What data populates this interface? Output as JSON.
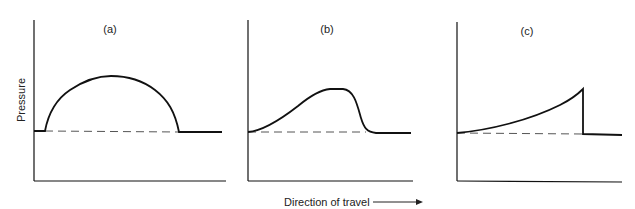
{
  "figure": {
    "y_axis_label": "Pressure",
    "x_axis_label": "Direction of travel",
    "panels": [
      {
        "label": "(a)",
        "shape": "semicircular pressure bulge"
      },
      {
        "label": "(b)",
        "shape": "gradual rise, sharp fall"
      },
      {
        "label": "(c)",
        "shape": "rising curve with abrupt drop"
      }
    ],
    "colors": {
      "line": "#111111",
      "dash": "#555555",
      "text": "#222222"
    }
  }
}
